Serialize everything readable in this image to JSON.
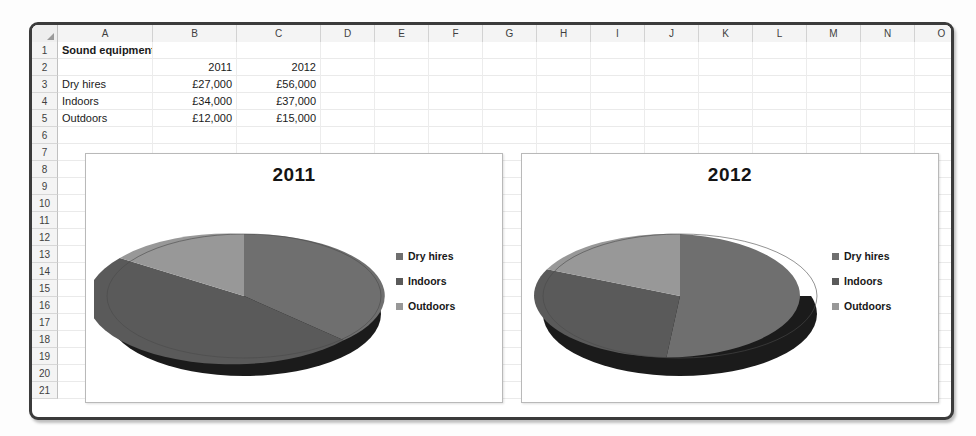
{
  "spreadsheet": {
    "columns": [
      "A",
      "B",
      "C",
      "D",
      "E",
      "F",
      "G",
      "H",
      "I",
      "J",
      "K",
      "L",
      "M",
      "N",
      "O"
    ],
    "column_widths": [
      95,
      84,
      84,
      54,
      54,
      54,
      54,
      54,
      54,
      54,
      54,
      54,
      54,
      54,
      54
    ],
    "rows": [
      "1",
      "2",
      "3",
      "4",
      "5",
      "6",
      "7",
      "8",
      "9",
      "10",
      "11",
      "12",
      "13",
      "14",
      "15",
      "16",
      "17",
      "18",
      "19",
      "20",
      "21"
    ],
    "cells": {
      "A1": "Sound equipment hires",
      "B2": "2011",
      "C2": "2012",
      "A3": "Dry hires",
      "B3": "£27,000",
      "C3": "£56,000",
      "A4": "Indoors",
      "B4": "£34,000",
      "C4": "£37,000",
      "A5": "Outdoors",
      "B5": "£12,000",
      "C5": "£15,000"
    }
  },
  "chart_data": [
    {
      "type": "pie",
      "title": "2011",
      "categories": [
        "Dry hires",
        "Indoors",
        "Outdoors"
      ],
      "values": [
        27000,
        34000,
        12000
      ],
      "value_labels": [
        "£27,000",
        "£34,000",
        "£12,000"
      ],
      "percentages": [
        37.0,
        46.6,
        16.4
      ],
      "colors": [
        "#6f6f6f",
        "#5a5a5a",
        "#989898"
      ],
      "side_colors": [
        "#1e1e1e",
        "#171717",
        "#3e3e3e"
      ],
      "legend_position": "right",
      "three_d": true,
      "xlabel": "",
      "ylabel": ""
    },
    {
      "type": "pie",
      "title": "2012",
      "categories": [
        "Dry hires",
        "Indoors",
        "Outdoors"
      ],
      "values": [
        56000,
        37000,
        15000
      ],
      "value_labels": [
        "£56,000",
        "£37,000",
        "£15,000"
      ],
      "percentages": [
        51.9,
        34.3,
        13.9
      ],
      "colors": [
        "#6f6f6f",
        "#5a5a5a",
        "#989898"
      ],
      "side_colors": [
        "#1e1e1e",
        "#171717",
        "#3e3e3e"
      ],
      "legend_position": "right",
      "three_d": true,
      "xlabel": "",
      "ylabel": ""
    }
  ]
}
